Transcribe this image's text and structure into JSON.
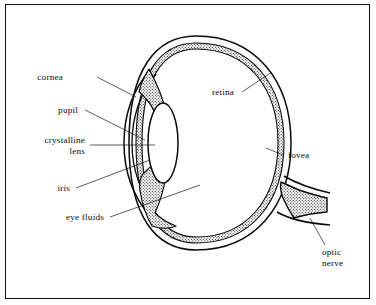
{
  "figure": {
    "background_color": "#fdfdfc",
    "ink_color": "#0d0d0d",
    "border_color": "#101010"
  },
  "labels": {
    "cornea": "cornea",
    "pupil": "pupil",
    "crystalline_lens_line1": "crystalline",
    "crystalline_lens_line2": "lens",
    "iris": "iris",
    "eye_fluids": "eye fluids",
    "retina": "retina",
    "fovea": "fovea",
    "optic_nerve_line1": "optic",
    "optic_nerve_line2": "nerve"
  },
  "diagram_data": {
    "type": "anatomical-cross-section",
    "subject": "human eye",
    "view": "horizontal cross-section, anterior at left, posterior at right",
    "structures": [
      {
        "name": "sclera",
        "rendering": "outer white wall band, double outline",
        "shaded": false
      },
      {
        "name": "retina",
        "rendering": "inner stippled wall band lining the globe",
        "shaded": true
      },
      {
        "name": "cornea",
        "rendering": "transparent anterior bulge arc",
        "shaded": false
      },
      {
        "name": "iris",
        "rendering": "stippled wedges above and below pupil aperture",
        "shaded": true
      },
      {
        "name": "pupil",
        "rendering": "gap between upper and lower iris",
        "shaded": false
      },
      {
        "name": "crystalline lens",
        "rendering": "white biconvex ellipse behind pupil",
        "shaded": false
      },
      {
        "name": "anterior chamber",
        "rendering": "clear space between cornea and iris",
        "shaded": false
      },
      {
        "name": "vitreous body",
        "rendering": "large clear interior of globe",
        "shaded": false
      },
      {
        "name": "ciliary body",
        "rendering": "stippled mass at iris root",
        "shaded": true
      },
      {
        "name": "fovea",
        "rendering": "point on posterior retina",
        "shaded": true
      },
      {
        "name": "optic nerve",
        "rendering": "stippled wedge exiting posterior globe at right",
        "shaded": true
      }
    ],
    "label_count": 8,
    "labels_left_side": [
      "cornea",
      "pupil",
      "crystalline lens",
      "iris",
      "eye fluids"
    ],
    "labels_right_side": [
      "retina",
      "fovea",
      "optic nerve"
    ]
  }
}
